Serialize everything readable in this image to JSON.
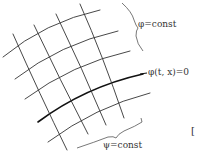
{
  "diagram": {
    "labels": {
      "phi_const": "φ=const",
      "phi_zero": "φ(t, x)=0",
      "psi_const": "ψ=const",
      "bracket_mark": "["
    },
    "families": [
      {
        "name": "phi-curves",
        "count": 5,
        "highlighted_index": 3
      },
      {
        "name": "psi-curves",
        "count": 5
      }
    ],
    "colors": {
      "line": "#333333",
      "highlight": "#111111",
      "background": "#ffffff"
    }
  }
}
